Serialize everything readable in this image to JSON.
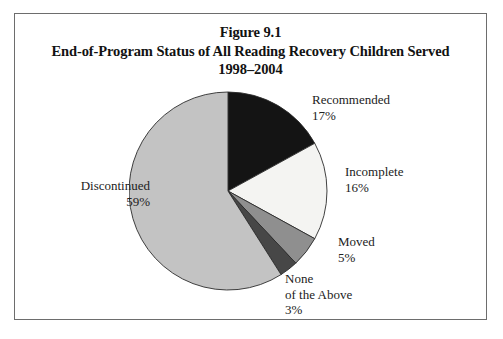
{
  "figure": {
    "title_line_1": "Figure 9.1",
    "title_line_2": "End-of-Program Status of All Reading Recovery Children Served",
    "title_line_3": "1998–2004"
  },
  "chart_data": {
    "type": "pie",
    "title": "Figure 9.1 End-of-Program Status of All Reading Recovery Children Served 1998–2004",
    "xlabel": "",
    "ylabel": "",
    "unit": "percent",
    "start_angle_deg": 0,
    "direction": "clockwise",
    "legend": "none (direct labels)",
    "categories": [
      "Recommended",
      "Incomplete",
      "Moved",
      "None of the Above",
      "Discontinued"
    ],
    "values": [
      17,
      16,
      5,
      3,
      59
    ],
    "value_labels": [
      "17%",
      "16%",
      "5%",
      "3%",
      "59%"
    ],
    "colors": [
      "#141414",
      "#f4f4f2",
      "#8f8f8f",
      "#474747",
      "#c3c3c3"
    ],
    "slices": [
      {
        "name": "Recommended",
        "value": 17,
        "value_label": "17%",
        "color": "#141414",
        "label_lines": [
          "Recommended",
          "17%"
        ]
      },
      {
        "name": "Incomplete",
        "value": 16,
        "value_label": "16%",
        "color": "#f4f4f2",
        "label_lines": [
          "Incomplete",
          "16%"
        ]
      },
      {
        "name": "Moved",
        "value": 5,
        "value_label": "5%",
        "color": "#8f8f8f",
        "label_lines": [
          "Moved",
          "5%"
        ]
      },
      {
        "name": "None of the Above",
        "value": 3,
        "value_label": "3%",
        "color": "#474747",
        "label_lines": [
          "None",
          "of the Above",
          "3%"
        ]
      },
      {
        "name": "Discontinued",
        "value": 59,
        "value_label": "59%",
        "color": "#c3c3c3",
        "label_lines": [
          "Discontinued",
          "59%"
        ]
      }
    ]
  },
  "labels": {
    "recommended": {
      "name": "Recommended",
      "value": "17%"
    },
    "incomplete": {
      "name": "Incomplete",
      "value": "16%"
    },
    "moved": {
      "name": "Moved",
      "value": "5%"
    },
    "none_above": {
      "line1": "None",
      "line2": "of the Above",
      "value": "3%"
    },
    "discontinued": {
      "name": "Discontinued",
      "value": "59%"
    }
  },
  "style": {
    "frame_color": "#6d6d6d",
    "background": "#ffffff",
    "text_color": "#222222"
  }
}
